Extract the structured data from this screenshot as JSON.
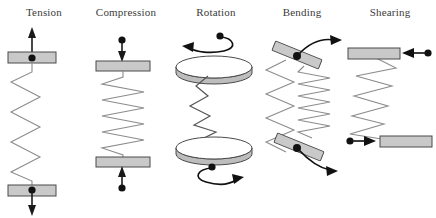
{
  "figure": {
    "title": "",
    "background_color": "#ffffff",
    "width": 436,
    "height": 218
  },
  "style": {
    "plate_fill": "#c9c9c9",
    "plate_stroke": "#4a4a4a",
    "spring_stroke": "#8c8c8c",
    "arrow_color": "#1a1a1a",
    "label_color": "#3b3b3b",
    "disc_fill": "#ffffff",
    "disc_edge_fill": "#bdbdbd"
  },
  "panels": [
    {
      "id": "tension",
      "label": "Tension",
      "spring_type": "vertical-stretched",
      "plates": 2,
      "arrows": [
        {
          "name": "force-arrow-up",
          "direction": "up",
          "has_dot_tail": false
        },
        {
          "name": "force-arrow-down",
          "direction": "down",
          "has_dot_tail": false
        }
      ],
      "pivot_dots": 2
    },
    {
      "id": "compression",
      "label": "Compression",
      "spring_type": "vertical-compressed",
      "plates": 2,
      "arrows": [
        {
          "name": "force-arrow-down",
          "direction": "down",
          "has_dot_tail": true
        },
        {
          "name": "force-arrow-up",
          "direction": "up",
          "has_dot_tail": true
        }
      ],
      "pivot_dots": 0
    },
    {
      "id": "rotation",
      "label": "Rotation",
      "spring_type": "twisted-zigzag",
      "plates": 2,
      "plate_shape": "disc",
      "arrows": [
        {
          "name": "torque-arrow-top",
          "direction": "curved-left",
          "has_dot_tail": true
        },
        {
          "name": "torque-arrow-bottom",
          "direction": "curved-right",
          "has_dot_tail": true
        }
      ],
      "pivot_dots": 0
    },
    {
      "id": "bending",
      "label": "Bending",
      "spring_type": "dual-stretched-compressed",
      "plates": 2,
      "plate_shape": "tilted-bar",
      "arrows": [
        {
          "name": "moment-arrow-top",
          "direction": "curved-up-right",
          "has_dot_tail": false
        },
        {
          "name": "moment-arrow-bottom",
          "direction": "curved-down-right",
          "has_dot_tail": false
        }
      ],
      "pivot_dots": 2
    },
    {
      "id": "shearing",
      "label": "Shearing",
      "spring_type": "slanted-zigzag",
      "plates": 2,
      "plate_shape": "horizontal-bar-offset",
      "arrows": [
        {
          "name": "shear-arrow-left",
          "direction": "left",
          "has_dot_tail": true
        },
        {
          "name": "shear-arrow-right",
          "direction": "right",
          "has_dot_tail": true
        }
      ],
      "pivot_dots": 0
    }
  ]
}
